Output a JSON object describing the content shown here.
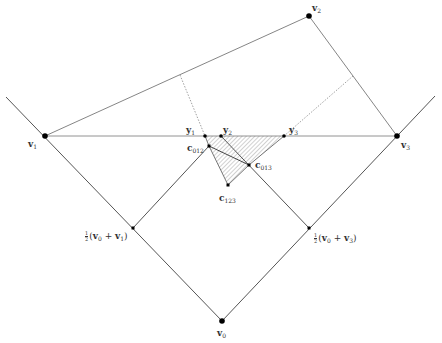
{
  "diagram": {
    "colors": {
      "line": "#555555",
      "dotted": "#888888",
      "point": "#000000",
      "hatch": "#9a9a9a",
      "label": "#333333"
    },
    "points": {
      "v0": {
        "x": 222,
        "y": 321,
        "label_base": "v",
        "label_sub": "0"
      },
      "v1": {
        "x": 45,
        "y": 136,
        "label_base": "v",
        "label_sub": "1"
      },
      "v2": {
        "x": 309,
        "y": 16,
        "label_base": "v",
        "label_sub": "2"
      },
      "v3": {
        "x": 397,
        "y": 136,
        "label_base": "v",
        "label_sub": "3"
      },
      "m01": {
        "x": 133,
        "y": 228,
        "label": "½(v₀ + v₁)"
      },
      "m03": {
        "x": 309,
        "y": 228,
        "label": "½(v₀ + v₃)"
      },
      "y1": {
        "x": 205,
        "y": 136,
        "label_base": "y",
        "label_sub": "1"
      },
      "y2": {
        "x": 221,
        "y": 136,
        "label_base": "y",
        "label_sub": "2"
      },
      "y3": {
        "x": 284,
        "y": 136,
        "label_base": "y",
        "label_sub": "3"
      },
      "c012": {
        "x": 209,
        "y": 146,
        "label_base": "c",
        "label_sub": "012"
      },
      "c013": {
        "x": 249,
        "y": 165,
        "label_base": "c",
        "label_sub": "013"
      },
      "c123": {
        "x": 228,
        "y": 185,
        "label_base": "c",
        "label_sub": "123"
      }
    },
    "labels": {
      "v0": {
        "base": "v",
        "sub": "0"
      },
      "v1": {
        "base": "v",
        "sub": "1"
      },
      "v2": {
        "base": "v",
        "sub": "2"
      },
      "v3": {
        "base": "v",
        "sub": "3"
      },
      "y1": {
        "base": "y",
        "sub": "1"
      },
      "y2": {
        "base": "y",
        "sub": "2"
      },
      "y3": {
        "base": "y",
        "sub": "3"
      },
      "c012": {
        "base": "c",
        "sub": "012"
      },
      "c013": {
        "base": "c",
        "sub": "013"
      },
      "c123": {
        "base": "c",
        "sub": "123"
      },
      "m01": {
        "num": "1",
        "den": "2",
        "open": "(",
        "a": "v",
        "a_sub": "0",
        "plus": " + ",
        "b": "v",
        "b_sub": "1",
        "close": ")"
      },
      "m03": {
        "num": "1",
        "den": "2",
        "open": "(",
        "a": "v",
        "a_sub": "0",
        "plus": " + ",
        "b": "v",
        "b_sub": "3",
        "close": ")"
      }
    }
  }
}
